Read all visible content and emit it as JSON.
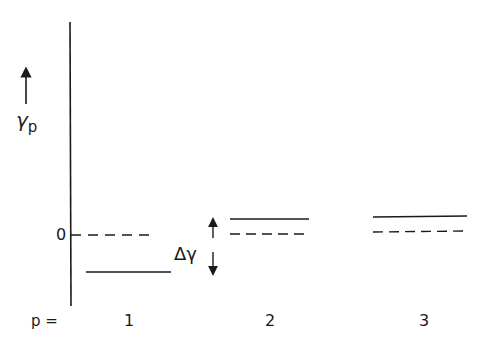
{
  "diagram": {
    "type": "energy-level-diagram",
    "y_axis": {
      "label_symbol": "γ",
      "label_subscript": "p",
      "arrow": "up",
      "zero_label": "0"
    },
    "x_axis": {
      "prefix_label": "p =",
      "categories": [
        "1",
        "2",
        "3"
      ]
    },
    "levels": [
      {
        "p": "1",
        "reference_dashed_y": 0,
        "solid_level": "below zero"
      },
      {
        "p": "2",
        "reference_dashed_y": 0,
        "solid_level": "slightly above dashed"
      },
      {
        "p": "3",
        "reference_dashed_y": 0,
        "solid_level": "slightly above dashed"
      }
    ],
    "annotation": {
      "label": "Δγ",
      "symbol": "double-headed vertical arrow"
    },
    "line_color": "#1a1a1a"
  }
}
